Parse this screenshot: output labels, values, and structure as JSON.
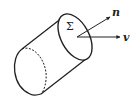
{
  "diagram": {
    "type": "cylinder-flux",
    "surface_label": "Σ",
    "normal_label": "n",
    "velocity_label": "v",
    "colors": {
      "stroke": "#222222",
      "background": "#ffffff"
    }
  }
}
